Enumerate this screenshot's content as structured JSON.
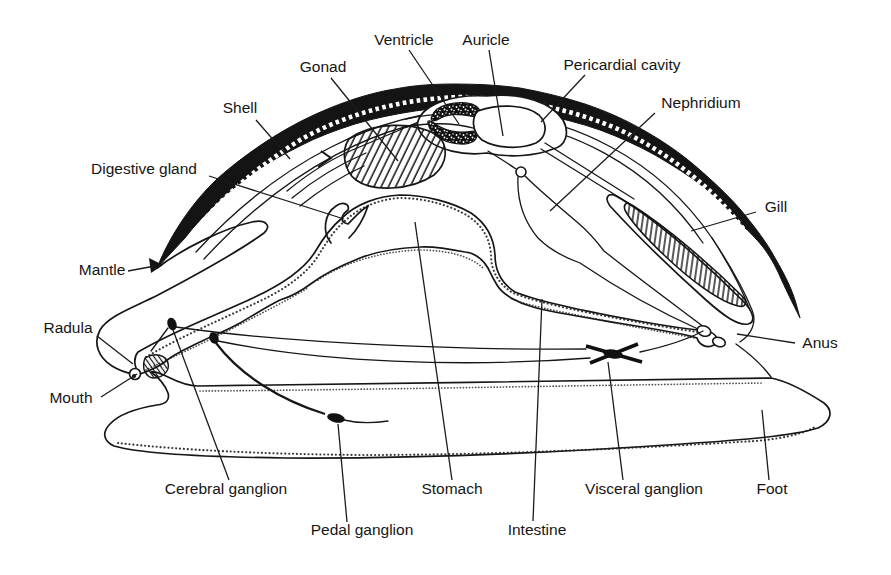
{
  "canvas": {
    "width": 891,
    "height": 575,
    "background": "#ffffff"
  },
  "colors": {
    "ink": "#161616",
    "shell_fill": "#141414",
    "label_text": "#151515",
    "paper": "#ffffff"
  },
  "labels": [
    {
      "id": "ventricle",
      "text": "Ventricle",
      "x": 404,
      "y": 45,
      "leader": [
        409,
        50,
        459,
        124
      ]
    },
    {
      "id": "auricle",
      "text": "Auricle",
      "x": 486,
      "y": 45,
      "leader": [
        489,
        50,
        503,
        136
      ]
    },
    {
      "id": "gonad",
      "text": "Gonad",
      "x": 323,
      "y": 72,
      "leader": [
        331,
        78,
        398,
        161
      ]
    },
    {
      "id": "pericardial-cavity",
      "text": "Pericardial cavity",
      "x": 622,
      "y": 70,
      "leader": [
        585,
        75,
        541,
        122
      ]
    },
    {
      "id": "shell",
      "text": "Shell",
      "x": 240,
      "y": 113,
      "leader": [
        256,
        120,
        290,
        159
      ]
    },
    {
      "id": "nephridium",
      "text": "Nephridium",
      "x": 701,
      "y": 108,
      "leader": [
        655,
        113,
        550,
        211
      ]
    },
    {
      "id": "digestive-gland",
      "text": "Digestive gland",
      "x": 144,
      "y": 174,
      "leader": [
        209,
        176,
        344,
        219
      ]
    },
    {
      "id": "gill",
      "text": "Gill",
      "x": 776,
      "y": 212,
      "leader": [
        756,
        212,
        691,
        231
      ]
    },
    {
      "id": "mantle",
      "text": "Mantle",
      "x": 102,
      "y": 275,
      "leader": [
        128,
        271,
        155,
        266
      ]
    },
    {
      "id": "radula",
      "text": "Radula",
      "x": 68,
      "y": 333,
      "leader": [
        97,
        336,
        133,
        364
      ]
    },
    {
      "id": "anus",
      "text": "Anus",
      "x": 820,
      "y": 348,
      "leader": [
        795,
        343,
        737,
        334
      ]
    },
    {
      "id": "mouth",
      "text": "Mouth",
      "x": 71,
      "y": 403,
      "leader": [
        101,
        397,
        137,
        374
      ]
    },
    {
      "id": "cerebral-ganglion",
      "text": "Cerebral ganglion",
      "x": 226,
      "y": 494,
      "leader": [
        229,
        480,
        173,
        330
      ]
    },
    {
      "id": "stomach",
      "text": "Stomach",
      "x": 452,
      "y": 494,
      "leader": [
        452,
        480,
        415,
        222
      ]
    },
    {
      "id": "visceral-ganglion",
      "text": "Visceral ganglion",
      "x": 644,
      "y": 494,
      "leader": [
        623,
        480,
        608,
        362
      ]
    },
    {
      "id": "foot",
      "text": "Foot",
      "x": 772,
      "y": 494,
      "leader": [
        769,
        480,
        762,
        410
      ]
    },
    {
      "id": "pedal-ganglion",
      "text": "Pedal ganglion",
      "x": 362,
      "y": 535,
      "leader": [
        347,
        522,
        338,
        424
      ]
    },
    {
      "id": "intestine",
      "text": "Intestine",
      "x": 537,
      "y": 535,
      "leader": [
        533,
        521,
        542,
        299
      ]
    }
  ]
}
